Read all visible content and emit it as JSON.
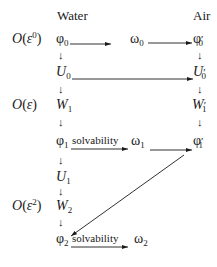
{
  "columns": {
    "left": "Water",
    "right": "Air"
  },
  "orders": [
    {
      "O": "O",
      "paren_open": "(",
      "eps": "ε",
      "power": "0",
      "paren_close": ")"
    },
    {
      "O": "O",
      "paren_open": "(",
      "eps": "ε",
      "power": "",
      "paren_close": ")"
    },
    {
      "O": "O",
      "paren_open": "(",
      "eps": "ε",
      "power": "2",
      "paren_close": ")"
    }
  ],
  "nodes": {
    "phi0": {
      "base": "φ",
      "sub": "0"
    },
    "omega0": {
      "base": "ω",
      "sub": "0"
    },
    "phi0p": {
      "base": "φ",
      "prime": "′",
      "sub": "0"
    },
    "U0": {
      "base": "U",
      "sub": "0"
    },
    "U0p": {
      "base": "U",
      "prime": "′",
      "sub": "0"
    },
    "W1": {
      "base": "W",
      "sub": "1"
    },
    "W1p": {
      "base": "W",
      "prime": "′",
      "sub": "1"
    },
    "phi1": {
      "base": "φ",
      "sub": "1"
    },
    "omega1": {
      "base": "ω",
      "sub": "1"
    },
    "phi1p": {
      "base": "φ",
      "prime": "′",
      "sub": "1"
    },
    "U1": {
      "base": "U",
      "sub": "1"
    },
    "W2": {
      "base": "W",
      "sub": "2"
    },
    "phi2": {
      "base": "φ",
      "sub": "2"
    },
    "omega2": {
      "base": "ω",
      "sub": "2"
    }
  },
  "edge_labels": {
    "solv1": "solvability",
    "solv2": "solvability"
  },
  "down_arrow": "↓"
}
